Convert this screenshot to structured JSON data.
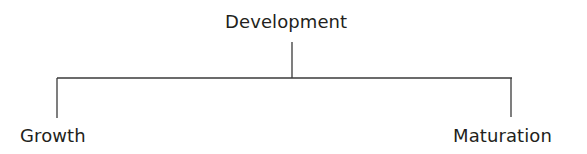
{
  "diagram": {
    "type": "tree",
    "root": {
      "label": "Development"
    },
    "children": [
      {
        "label": "Growth"
      },
      {
        "label": "Maturation"
      }
    ],
    "colors": {
      "text": "#231f20",
      "line": "#3a3a3a",
      "background": "#ffffff"
    }
  }
}
